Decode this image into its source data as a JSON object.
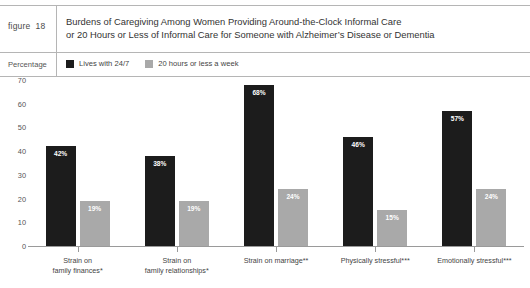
{
  "figure": {
    "label": "figure",
    "number": "18",
    "title_line1": "Burdens of Caregiving Among Women Providing Around-the-Clock Informal Care",
    "title_line2": "or 20 Hours or Less of Informal Care for Someone with Alzheimer’s Disease or Dementia"
  },
  "legend_band": {
    "axis_caption": "Percentage"
  },
  "colors": {
    "series_dark": "#1c1c1c",
    "series_light": "#a9a9a9",
    "rule": "#b5b5b5",
    "axis": "#9a9a9a",
    "text": "#333333"
  },
  "chart_data": {
    "type": "bar",
    "title": "Burdens of Caregiving Among Women Providing Around-the-Clock Informal Care or 20 Hours or Less of Informal Care for Someone with Alzheimer’s Disease or Dementia",
    "xlabel": "",
    "ylabel": "Percentage",
    "ylim": [
      0,
      70
    ],
    "yticks": [
      0,
      10,
      20,
      30,
      40,
      50,
      60,
      70
    ],
    "ytick_labels": [
      "0",
      "10",
      "20",
      "30",
      "40",
      "50",
      "60",
      "70"
    ],
    "grid": false,
    "legend_position": "top-left",
    "categories": [
      "Strain on family finances*",
      "Strain on family relationships*",
      "Strain on marriage**",
      "Physically stressful***",
      "Emotionally stressful***"
    ],
    "category_lines": [
      [
        "Strain on",
        "family finances*"
      ],
      [
        "Strain on",
        "family relationships*"
      ],
      [
        "Strain on marriage**"
      ],
      [
        "Physically stressful***"
      ],
      [
        "Emotionally stressful***"
      ]
    ],
    "series": [
      {
        "name": "Lives with 24/7",
        "color": "#1c1c1c",
        "values": [
          42,
          38,
          68,
          46,
          57
        ],
        "data_labels": [
          "42%",
          "38%",
          "68%",
          "46%",
          "57%"
        ]
      },
      {
        "name": "20 hours or less a week",
        "color": "#a9a9a9",
        "values": [
          19,
          19,
          24,
          15,
          24
        ],
        "data_labels": [
          "19%",
          "19%",
          "24%",
          "15%",
          "24%"
        ]
      }
    ]
  }
}
